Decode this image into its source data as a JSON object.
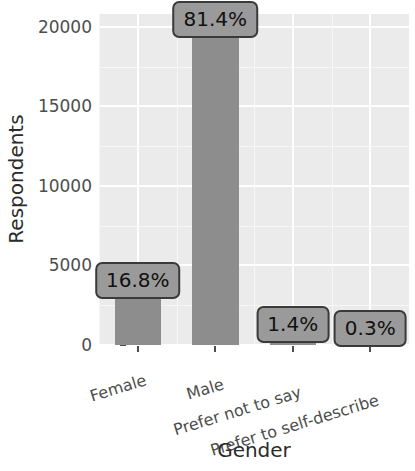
{
  "chart_data": {
    "type": "bar",
    "title": "",
    "xlabel": "Gender",
    "ylabel": "Respondents",
    "categories": [
      "Female",
      "Male",
      "Prefer not to say",
      "Prefer to self-describe"
    ],
    "values": [
      3100,
      19500,
      340,
      70
    ],
    "data_labels": [
      "16.8%",
      "81.4%",
      "1.4%",
      "0.3%"
    ],
    "percentages": [
      16.8,
      81.4,
      1.4,
      0.3
    ],
    "ylim": [
      0,
      20800
    ],
    "yticks": [
      0,
      5000,
      10000,
      15000,
      20000
    ],
    "ytick_labels": [
      "0",
      "5000",
      "10000",
      "15000",
      "20000"
    ],
    "grid": true,
    "legend": "none",
    "bar_color": "#8d8d8d",
    "panel_color": "#ebebeb",
    "gridline_color": "#ffffff",
    "label_box_fill": "#9a9a9a",
    "label_box_border": "#3a3a3a",
    "axis_text_color": "#4d4d4d",
    "axis_title_color": "#2b2b2b"
  }
}
